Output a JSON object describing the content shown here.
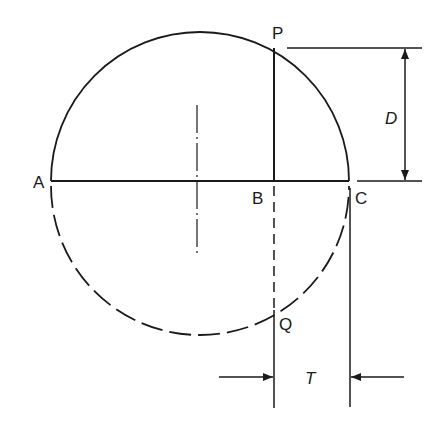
{
  "diagram": {
    "type": "geometry-construction",
    "stroke_color": "#1a1a1a",
    "background": "#ffffff",
    "labels": {
      "A": "A",
      "B": "B",
      "C": "C",
      "P": "P",
      "Q": "Q",
      "D": "D",
      "T": "T"
    },
    "circle": {
      "cx": 200,
      "cy": 181,
      "r": 149,
      "upper_half": "solid",
      "lower_half": "dashed"
    },
    "chord_AC": {
      "x1": 51,
      "x2": 349,
      "y": 181
    },
    "line_PQ": {
      "x": 274,
      "p_y": 48,
      "b_y": 181,
      "q_y": 310,
      "bottom_y": 408
    },
    "centerline": {
      "x": 197,
      "y1": 105,
      "y2": 255,
      "style": "dash-dot"
    },
    "dimension_D": {
      "x": 405,
      "y1": 48,
      "y2": 181,
      "label": "D"
    },
    "dimension_T": {
      "y": 377,
      "x1": 274,
      "x2": 350,
      "label": "T"
    }
  }
}
